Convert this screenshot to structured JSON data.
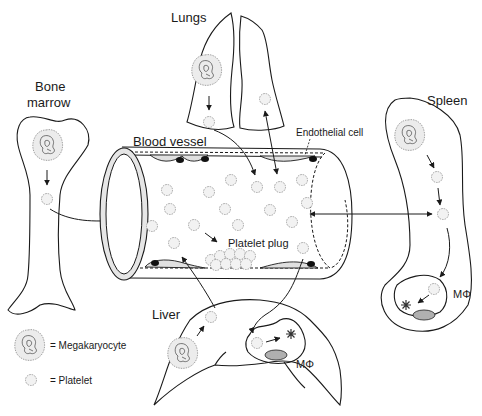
{
  "figure": {
    "type": "biological-diagram"
  },
  "labels": {
    "lungs": "Lungs",
    "bone_marrow_line1": "Bone",
    "bone_marrow_line2": "marrow",
    "blood_vessel": "Blood vessel",
    "endothelial_cell": "Endothelial cell",
    "spleen": "Spleen",
    "platelet_plug": "Platelet plug",
    "liver": "Liver",
    "macrophage_spleen": "MΦ",
    "macrophage_liver": "MΦ"
  },
  "legend": {
    "items": [
      {
        "symbol": "megakaryocyte",
        "label": "= Megakaryocyte"
      },
      {
        "symbol": "platelet",
        "label": "= Platelet"
      }
    ]
  },
  "colors": {
    "line": "#1a1a1a",
    "cell_fill": "#ececec",
    "cell_outline": "#9a9a9a",
    "macrophage_nucleus": "#b0b0b0",
    "background": "#ffffff"
  }
}
